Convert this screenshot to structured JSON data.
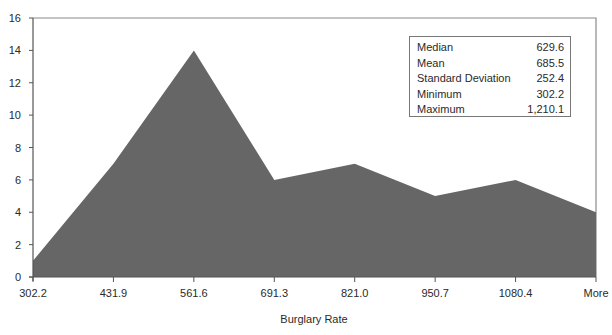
{
  "chart_data": {
    "type": "area",
    "title": "",
    "xlabel": "Burglary Rate",
    "ylabel": "",
    "categories": [
      "302.2",
      "431.9",
      "561.6",
      "691.3",
      "821.0",
      "950.7",
      "1080.4",
      "More"
    ],
    "values": [
      1,
      7,
      14,
      6,
      7,
      5,
      6,
      4
    ],
    "ylim": [
      0,
      16
    ],
    "yticks": [
      0,
      2,
      4,
      6,
      8,
      10,
      12,
      14,
      16
    ],
    "grid": false,
    "fill_color": "#666666",
    "legend": null,
    "annotation_box": {
      "rows": [
        {
          "label": "Median",
          "value": "629.6"
        },
        {
          "label": "Mean",
          "value": "685.5"
        },
        {
          "label": "Standard Deviation",
          "value": "252.4"
        },
        {
          "label": "Minimum",
          "value": "302.2"
        },
        {
          "label": "Maximum",
          "value": "1,210.1"
        }
      ]
    }
  }
}
